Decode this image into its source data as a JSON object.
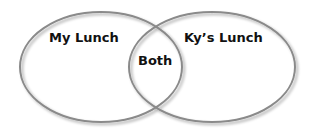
{
  "diagram": {
    "type": "venn",
    "sets": [
      {
        "id": "left",
        "label": "My Lunch"
      },
      {
        "id": "right",
        "label": "Ky’s Lunch"
      }
    ],
    "intersection": {
      "label": "Both"
    },
    "colors": {
      "stroke": "#8a8a8a",
      "shadow": "#c8c8c8",
      "fill": "#ffffff",
      "text": "#111111"
    }
  }
}
